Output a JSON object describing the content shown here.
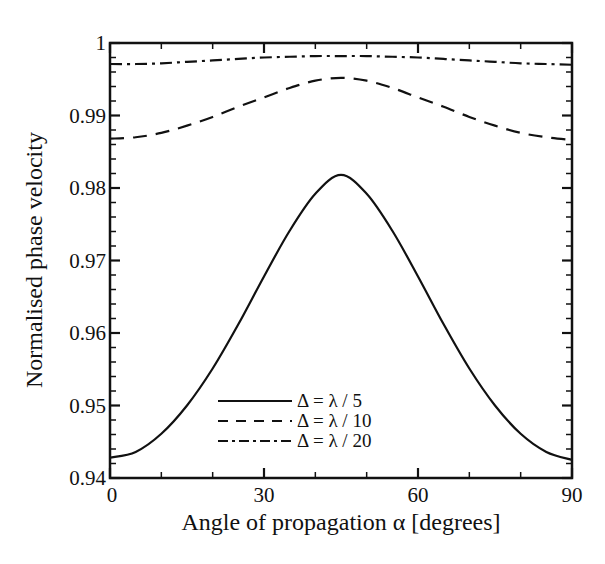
{
  "chart_data": {
    "type": "line",
    "title": "",
    "xlabel": "Angle of propagation α [degrees]",
    "ylabel": "Normalised phase velocity",
    "xlim": [
      0,
      90
    ],
    "ylim": [
      0.94,
      1.0
    ],
    "x_ticks": [
      "0",
      "30",
      "60",
      "90"
    ],
    "y_ticks": [
      "0.94",
      "0.95",
      "0.96",
      "0.97",
      "0.98",
      "0.99",
      "1"
    ],
    "grid": false,
    "legend_position": "lower center",
    "x": [
      0,
      5,
      10,
      15,
      20,
      25,
      30,
      35,
      40,
      45,
      50,
      55,
      60,
      65,
      70,
      75,
      80,
      85,
      90
    ],
    "series": [
      {
        "name": "Δ = λ / 5",
        "style": "solid",
        "values": [
          0.9428,
          0.9436,
          0.9461,
          0.95,
          0.9551,
          0.9612,
          0.9678,
          0.9741,
          0.9792,
          0.9818,
          0.9792,
          0.9741,
          0.9678,
          0.9612,
          0.9551,
          0.95,
          0.9461,
          0.9436,
          0.9425
        ]
      },
      {
        "name": "Δ = λ / 10",
        "style": "dashed",
        "values": [
          0.9868,
          0.987,
          0.9876,
          0.9886,
          0.9898,
          0.9912,
          0.9925,
          0.9938,
          0.9948,
          0.9952,
          0.9948,
          0.9938,
          0.9925,
          0.9912,
          0.9898,
          0.9886,
          0.9876,
          0.987,
          0.9866
        ]
      },
      {
        "name": "Δ = λ / 20",
        "style": "dashdot",
        "values": [
          0.9971,
          0.9971,
          0.9972,
          0.9974,
          0.9976,
          0.9978,
          0.998,
          0.9981,
          0.9982,
          0.9982,
          0.9982,
          0.9981,
          0.998,
          0.9978,
          0.9976,
          0.9974,
          0.9972,
          0.9971,
          0.997
        ]
      }
    ]
  },
  "legend": {
    "items": [
      {
        "label": "Δ = λ / 5"
      },
      {
        "label": "Δ = λ / 10"
      },
      {
        "label": "Δ = λ / 20"
      }
    ]
  }
}
